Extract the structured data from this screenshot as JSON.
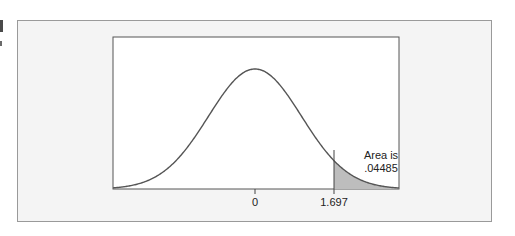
{
  "chart_data": {
    "type": "area",
    "title": "",
    "distribution": "t / normal-shaped density curve",
    "xlabel": "",
    "ylabel": "",
    "tick_labels": [
      "0",
      "1.697"
    ],
    "tick_values": [
      0,
      1.697
    ],
    "shaded_region": {
      "from": 1.697,
      "to": "inf",
      "tail": "right"
    },
    "annotation": {
      "line1": "Area is",
      "line2": ".04485"
    },
    "area_value": 0.04485,
    "grid": false,
    "legend": null
  },
  "labels": {
    "tick0": "0",
    "tick1": "1.697",
    "ann1": "Area is",
    "ann2": ".04485"
  },
  "colors": {
    "curve": "#555555",
    "shade": "#bdbdbd",
    "frame_bg": "#f4f4f4"
  }
}
